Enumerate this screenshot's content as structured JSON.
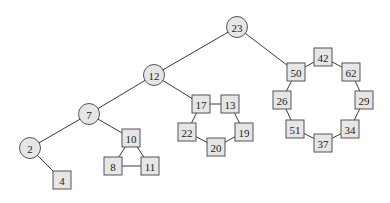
{
  "diagram": {
    "type": "graph",
    "node_style": {
      "fill": "#e6e6e6",
      "stroke": "#555555",
      "edge": "#3a3a3a"
    },
    "nodes": [
      {
        "id": "23",
        "label": "23",
        "shape": "circle",
        "x": 237,
        "y": 27
      },
      {
        "id": "12",
        "label": "12",
        "shape": "circle",
        "x": 154,
        "y": 75
      },
      {
        "id": "7",
        "label": "7",
        "shape": "circle",
        "x": 89,
        "y": 114
      },
      {
        "id": "2",
        "label": "2",
        "shape": "circle",
        "x": 30,
        "y": 148
      },
      {
        "id": "4",
        "label": "4",
        "shape": "square",
        "x": 62,
        "y": 180
      },
      {
        "id": "10",
        "label": "10",
        "shape": "square",
        "x": 131,
        "y": 138
      },
      {
        "id": "8",
        "label": "8",
        "shape": "square",
        "x": 113,
        "y": 166
      },
      {
        "id": "11",
        "label": "11",
        "shape": "square",
        "x": 150,
        "y": 166
      },
      {
        "id": "17",
        "label": "17",
        "shape": "square",
        "x": 201,
        "y": 104
      },
      {
        "id": "13",
        "label": "13",
        "shape": "square",
        "x": 230,
        "y": 104
      },
      {
        "id": "22",
        "label": "22",
        "shape": "square",
        "x": 187,
        "y": 132
      },
      {
        "id": "19",
        "label": "19",
        "shape": "square",
        "x": 244,
        "y": 132
      },
      {
        "id": "20",
        "label": "20",
        "shape": "square",
        "x": 216,
        "y": 147
      },
      {
        "id": "50",
        "label": "50",
        "shape": "square",
        "x": 296,
        "y": 72
      },
      {
        "id": "42",
        "label": "42",
        "shape": "square",
        "x": 323,
        "y": 57
      },
      {
        "id": "62",
        "label": "62",
        "shape": "square",
        "x": 351,
        "y": 72
      },
      {
        "id": "26",
        "label": "26",
        "shape": "square",
        "x": 282,
        "y": 100
      },
      {
        "id": "29",
        "label": "29",
        "shape": "square",
        "x": 364,
        "y": 100
      },
      {
        "id": "51",
        "label": "51",
        "shape": "square",
        "x": 295,
        "y": 129
      },
      {
        "id": "34",
        "label": "34",
        "shape": "square",
        "x": 350,
        "y": 129
      },
      {
        "id": "37",
        "label": "37",
        "shape": "square",
        "x": 323,
        "y": 143
      }
    ],
    "edges": [
      [
        "23",
        "12"
      ],
      [
        "23",
        "50"
      ],
      [
        "12",
        "7"
      ],
      [
        "12",
        "17"
      ],
      [
        "7",
        "2"
      ],
      [
        "7",
        "10"
      ],
      [
        "2",
        "4"
      ],
      [
        "10",
        "8"
      ],
      [
        "10",
        "11"
      ],
      [
        "8",
        "11"
      ],
      [
        "17",
        "13"
      ],
      [
        "17",
        "22"
      ],
      [
        "13",
        "19"
      ],
      [
        "22",
        "20"
      ],
      [
        "19",
        "20"
      ],
      [
        "50",
        "42"
      ],
      [
        "42",
        "62"
      ],
      [
        "62",
        "29"
      ],
      [
        "29",
        "34"
      ],
      [
        "34",
        "37"
      ],
      [
        "37",
        "51"
      ],
      [
        "51",
        "26"
      ],
      [
        "26",
        "50"
      ]
    ]
  }
}
